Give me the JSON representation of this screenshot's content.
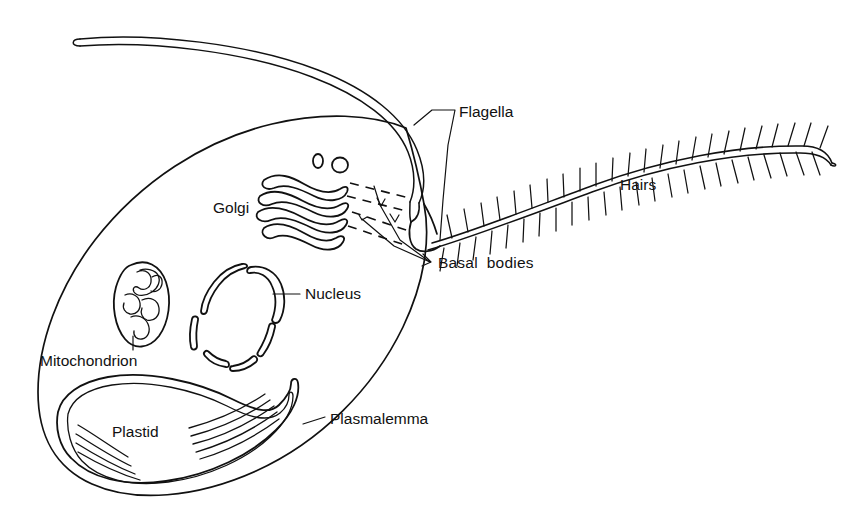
{
  "diagram": {
    "background_color": "#ffffff",
    "ink_color": "#111111",
    "width": 859,
    "height": 526
  },
  "labels": {
    "flagella": "Flagella",
    "hairs": "Hairs",
    "golgi": "Golgi",
    "basal_bodies": "Basal  bodies",
    "nucleus": "Nucleus",
    "mitochondrion": "Mitochondrion",
    "plastid": "Plastid",
    "plasmalemma": "Plasmalemma"
  },
  "structures": [
    {
      "key": "cell-body",
      "name": "Cell body",
      "label": "Plasmalemma",
      "kind": "outline"
    },
    {
      "key": "smooth-flagellum",
      "name": "Smooth flagellum",
      "label": "Flagella",
      "kind": "flagellum"
    },
    {
      "key": "hairy-flagellum",
      "name": "Hairy flagellum",
      "label": "Flagella",
      "kind": "flagellum"
    },
    {
      "key": "flagellar-hairs",
      "name": "Flagellar hairs",
      "label": "Hairs",
      "kind": "appendage"
    },
    {
      "key": "golgi",
      "name": "Golgi apparatus",
      "label": "Golgi",
      "kind": "organelle"
    },
    {
      "key": "golgi-vesicles",
      "name": "Golgi vesicles",
      "label": "Golgi",
      "kind": "organelle"
    },
    {
      "key": "basal-bodies",
      "name": "Basal bodies",
      "label": "Basal  bodies",
      "kind": "organelle"
    },
    {
      "key": "nucleus",
      "name": "Nucleus",
      "label": "Nucleus",
      "kind": "organelle"
    },
    {
      "key": "mitochondrion",
      "name": "Mitochondrion",
      "label": "Mitochondrion",
      "kind": "organelle"
    },
    {
      "key": "plastid",
      "name": "Plastid",
      "label": "Plastid",
      "kind": "organelle"
    }
  ],
  "counts": {
    "flagella": 2,
    "golgi_cisternae": 4,
    "golgi_vesicles": 2,
    "basal_bodies": 2,
    "nucleus_arc_segments": 6,
    "plastid_thylakoid_groups": 2
  }
}
